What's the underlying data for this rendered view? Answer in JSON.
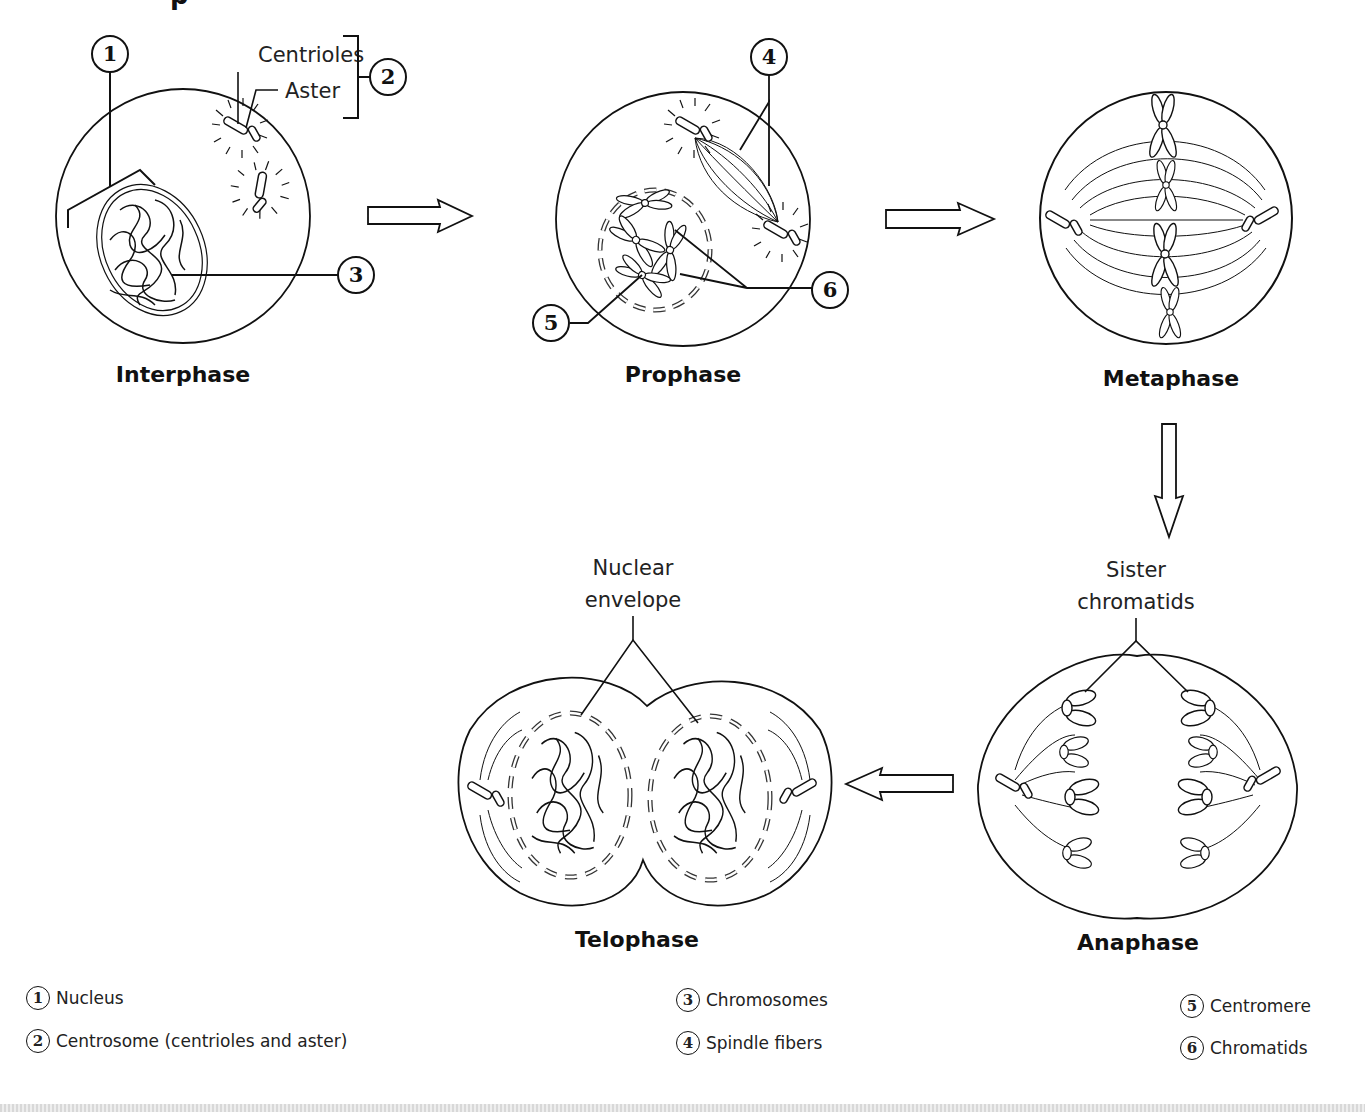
{
  "title_fragment": "p",
  "stages": [
    {
      "id": "interphase",
      "label": "Interphase"
    },
    {
      "id": "prophase",
      "label": "Prophase"
    },
    {
      "id": "metaphase",
      "label": "Metaphase"
    },
    {
      "id": "anaphase",
      "label": "Anaphase"
    },
    {
      "id": "telophase",
      "label": "Telophase"
    }
  ],
  "callouts": {
    "centrioles": "Centrioles",
    "aster": "Aster",
    "sister_chromatids_line1": "Sister",
    "sister_chromatids_line2": "chromatids",
    "nuclear_envelope_line1": "Nuclear",
    "nuclear_envelope_line2": "envelope"
  },
  "markers": [
    "1",
    "2",
    "3",
    "4",
    "5",
    "6"
  ],
  "legend": [
    {
      "num": "1",
      "label": "Nucleus"
    },
    {
      "num": "2",
      "label": "Centrosome (centrioles and aster)"
    },
    {
      "num": "3",
      "label": "Chromosomes"
    },
    {
      "num": "4",
      "label": "Spindle fibers"
    },
    {
      "num": "5",
      "label": "Centromere"
    },
    {
      "num": "6",
      "label": "Chromatids"
    }
  ],
  "arrows": [
    {
      "from": "interphase",
      "to": "prophase",
      "direction": "right"
    },
    {
      "from": "prophase",
      "to": "metaphase",
      "direction": "right"
    },
    {
      "from": "metaphase",
      "to": "anaphase",
      "direction": "down"
    },
    {
      "from": "anaphase",
      "to": "telophase",
      "direction": "left"
    }
  ]
}
